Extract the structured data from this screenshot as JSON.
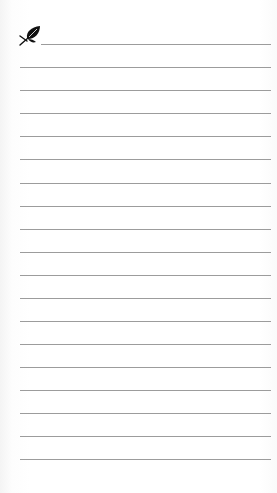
{
  "page": {
    "type": "lined-notepad",
    "background_color": "#ffffff",
    "line_color": "#9c9c9c"
  },
  "header": {
    "icon": "leaf-icon",
    "icon_color": "#111111"
  },
  "lines": {
    "count": 19,
    "first_line": {
      "y": 44,
      "x_start": 41,
      "x_end": 271
    },
    "other_lines": {
      "x_start": 20,
      "x_end": 271
    },
    "y_positions": [
      44,
      67,
      90,
      113,
      136,
      159,
      183,
      206,
      229,
      252,
      275,
      298,
      321,
      344,
      367,
      390,
      413,
      436,
      459
    ]
  }
}
